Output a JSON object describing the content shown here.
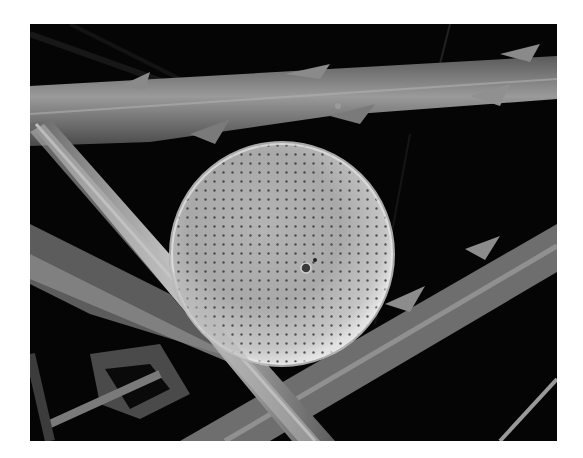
{
  "image": {
    "kind": "scanning electron micrograph",
    "subject": "centric diatom frustule resting on spiny fibers",
    "alt": "Grayscale SEM image of a circular perforated diatom valve lying among long spiny needle-like fibers on a black background",
    "background_color": "#ffffff",
    "frame_color": "#050505",
    "diatom_color": "#c9c9c9"
  }
}
